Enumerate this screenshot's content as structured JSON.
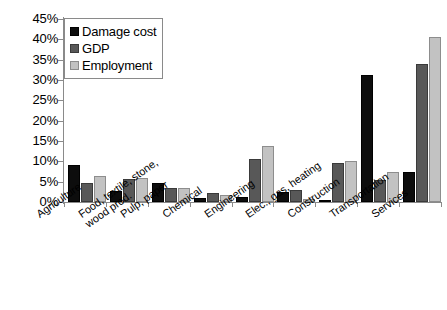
{
  "chart_data": {
    "type": "bar",
    "title": "",
    "xlabel": "",
    "ylabel": "",
    "ylim": [
      0,
      45
    ],
    "grid": false,
    "legend_position": "top-left",
    "ytick_labels": [
      "45%",
      "40%",
      "35%",
      "30%",
      "25%",
      "20%",
      "15%",
      "10%",
      "5%",
      "0%"
    ],
    "ytick_values": [
      45,
      40,
      35,
      30,
      25,
      20,
      15,
      10,
      5,
      0
    ],
    "categories": [
      "Agriculture",
      "Food, textile, stone, wood prod.",
      "Pulp, paper",
      "Chemical",
      "Engineering",
      "Elec., gas, heating",
      "Construction",
      "Transportation",
      "Services"
    ],
    "category_lines": [
      [
        "Agriculture",
        ""
      ],
      [
        "Food, textile, stone,",
        "wood prod."
      ],
      [
        "Pulp, paper",
        ""
      ],
      [
        "Chemical",
        ""
      ],
      [
        "Engineering",
        ""
      ],
      [
        "Elec., gas, heating",
        ""
      ],
      [
        "Construction",
        ""
      ],
      [
        "Transportation",
        ""
      ],
      [
        "Services",
        ""
      ]
    ],
    "series": [
      {
        "name": "Damage cost",
        "color": "#0d0d0d",
        "values": [
          9.0,
          2.7,
          4.6,
          1.0,
          1.3,
          2.5,
          0.5,
          31.3,
          7.4
        ]
      },
      {
        "name": "GDP",
        "color": "#585858",
        "values": [
          4.7,
          5.7,
          3.5,
          2.2,
          10.7,
          3.0,
          9.5,
          5.5,
          34.0
        ]
      },
      {
        "name": "Employment",
        "color": "#c2c2c2",
        "values": [
          6.4,
          5.8,
          3.5,
          1.8,
          13.8,
          0.8,
          10.0,
          7.5,
          40.5
        ]
      }
    ]
  },
  "legend": {
    "items": [
      {
        "label": "Damage cost"
      },
      {
        "label": "GDP"
      },
      {
        "label": "Employment"
      }
    ]
  }
}
